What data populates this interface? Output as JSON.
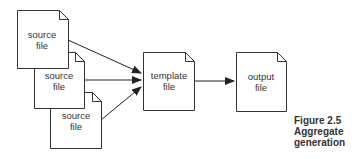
{
  "diagram": {
    "nodes": [
      {
        "id": "source1",
        "line1": "source",
        "line2": "file"
      },
      {
        "id": "source2",
        "line1": "source",
        "line2": "file"
      },
      {
        "id": "source3",
        "line1": "source",
        "line2": "file"
      },
      {
        "id": "template",
        "line1": "template",
        "line2": "file"
      },
      {
        "id": "output",
        "line1": "output",
        "line2": "file"
      }
    ],
    "edges": [
      {
        "from": "source1",
        "to": "template"
      },
      {
        "from": "source2",
        "to": "template"
      },
      {
        "from": "source3",
        "to": "template"
      },
      {
        "from": "template",
        "to": "output"
      }
    ]
  },
  "caption": {
    "figure": "Figure 2.5",
    "line2": "Aggregate",
    "line3": "generation"
  },
  "colors": {
    "stroke": "#333333",
    "fill": "#ffffff"
  }
}
